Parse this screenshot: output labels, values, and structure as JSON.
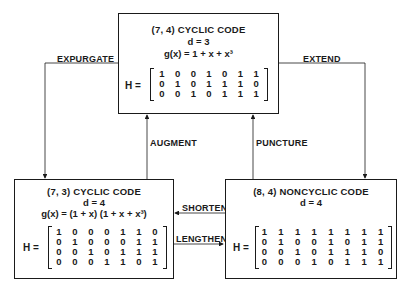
{
  "nodes": {
    "top": {
      "title": "(7, 4) CYCLIC CODE",
      "distance": "d = 3",
      "generator": "g(x) = 1 + x + x³",
      "matrix_label": "H =",
      "matrix": [
        [
          "1",
          "0",
          "0",
          "1",
          "0",
          "1",
          "1"
        ],
        [
          "0",
          "1",
          "0",
          "1",
          "1",
          "1",
          "0"
        ],
        [
          "0",
          "0",
          "1",
          "0",
          "1",
          "1",
          "1"
        ]
      ]
    },
    "left": {
      "title": "(7, 3) CYCLIC CODE",
      "distance": "d = 4",
      "generator": "g(x) = (1 + x) (1 + x + x³)",
      "matrix_label": "H =",
      "matrix": [
        [
          "1",
          "0",
          "0",
          "0",
          "1",
          "1",
          "0"
        ],
        [
          "0",
          "1",
          "0",
          "0",
          "0",
          "1",
          "1"
        ],
        [
          "0",
          "0",
          "1",
          "0",
          "1",
          "1",
          "1"
        ],
        [
          "0",
          "0",
          "0",
          "1",
          "1",
          "0",
          "1"
        ]
      ]
    },
    "right": {
      "title": "(8, 4) NONCYCLIC CODE",
      "distance": "d = 4",
      "matrix_label": "H =",
      "matrix": [
        [
          "1",
          "1",
          "1",
          "1",
          "1",
          "1",
          "1",
          "1"
        ],
        [
          "0",
          "1",
          "0",
          "0",
          "1",
          "0",
          "1",
          "1"
        ],
        [
          "0",
          "0",
          "1",
          "0",
          "1",
          "1",
          "1",
          "0"
        ],
        [
          "0",
          "0",
          "0",
          "1",
          "0",
          "1",
          "1",
          "1"
        ]
      ]
    }
  },
  "edges": {
    "expurgate": "EXPURGATE",
    "extend": "EXTEND",
    "augment": "AUGMENT",
    "puncture": "PUNCTURE",
    "shorten": "SHORTEN",
    "lengthen": "LENGTHEN"
  }
}
